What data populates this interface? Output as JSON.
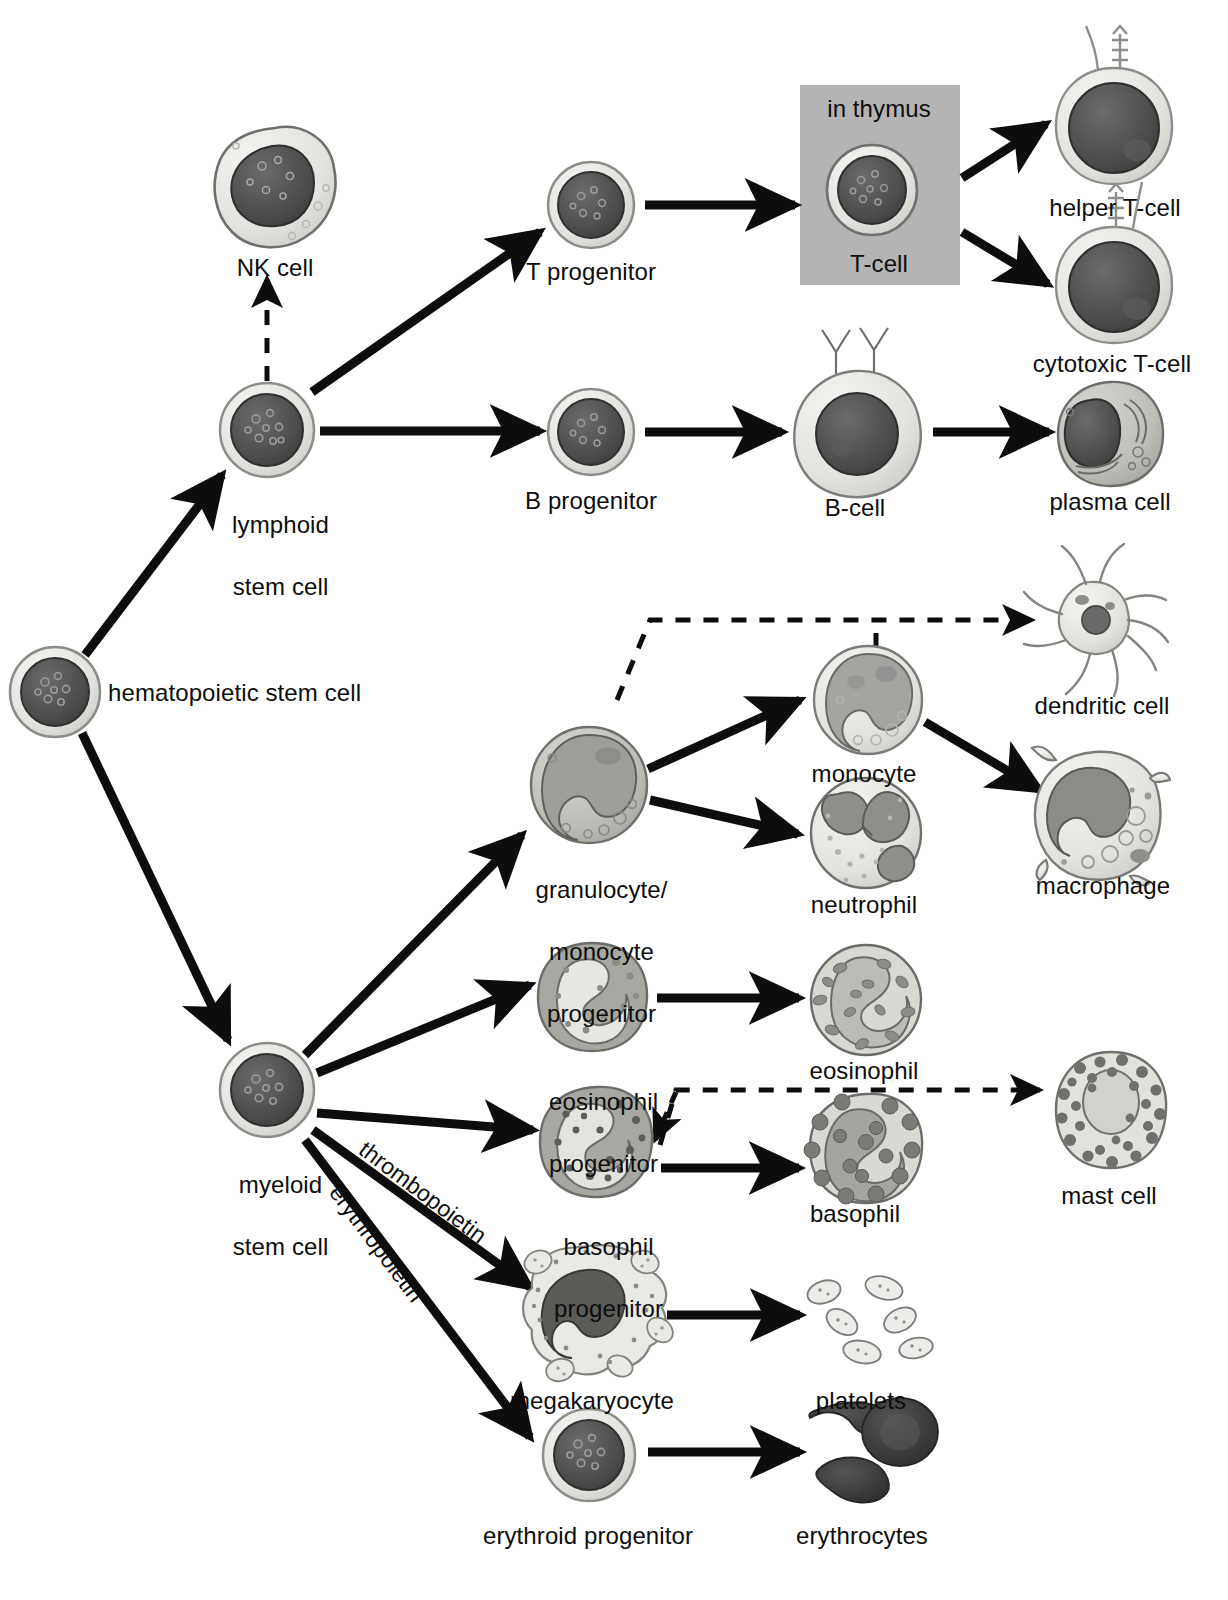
{
  "diagram": {
    "background_color": "#ffffff",
    "ink_color": "#0d0d0d",
    "thymus_box_color": "#b4b4b4"
  },
  "labels": {
    "hematopoietic_stem_cell": "hematopoietic stem cell",
    "lymphoid_stem_cell_line1": "lymphoid",
    "lymphoid_stem_cell_line2": "stem cell",
    "nk_cell": "NK cell",
    "t_progenitor": "T progenitor",
    "b_progenitor": "B progenitor",
    "in_thymus": "in thymus",
    "t_cell": "T-cell",
    "helper_t_cell": "helper T-cell",
    "cytotoxic_t_cell": "cytotoxic T-cell",
    "b_cell": "B-cell",
    "plasma_cell": "plasma cell",
    "myeloid_stem_cell_line1": "myeloid",
    "myeloid_stem_cell_line2": "stem cell",
    "gm_progenitor_line1": "granulocyte/",
    "gm_progenitor_line2": "monocyte",
    "gm_progenitor_line3": "progenitor",
    "monocyte": "monocyte",
    "neutrophil": "neutrophil",
    "dendritic_cell": "dendritic cell",
    "macrophage": "macrophage",
    "eosinophil_progenitor_line1": "eosinophil",
    "eosinophil_progenitor_line2": "progenitor",
    "eosinophil": "eosinophil",
    "basophil_progenitor_line1": "basophil",
    "basophil_progenitor_line2": "progenitor",
    "basophil": "basophil",
    "mast_cell": "mast cell",
    "megakaryocyte": "megakaryocyte",
    "platelets": "platelets",
    "erythroid_progenitor": "erythroid progenitor",
    "erythrocytes": "erythrocytes",
    "thrombopoietin": "thrombopoietin",
    "erythropoietin": "erythropoietin"
  },
  "nodes": [
    {
      "id": "hsc",
      "name": "hematopoietic-stem-cell",
      "cx": 55,
      "cy": 692,
      "r": 45,
      "type": "round-stem"
    },
    {
      "id": "lymphoid",
      "name": "lymphoid-stem-cell",
      "cx": 267,
      "cy": 430,
      "r": 47,
      "type": "round-stem"
    },
    {
      "id": "nk",
      "name": "nk-cell",
      "cx": 275,
      "cy": 186,
      "r": 60,
      "type": "nk"
    },
    {
      "id": "tprog",
      "name": "t-progenitor",
      "cx": 591,
      "cy": 205,
      "r": 43,
      "type": "round-stem"
    },
    {
      "id": "bprog",
      "name": "b-progenitor",
      "cx": 591,
      "cy": 432,
      "r": 43,
      "type": "round-stem"
    },
    {
      "id": "tcell",
      "name": "t-cell",
      "cx": 872,
      "cy": 190,
      "r": 44,
      "type": "round-stem"
    },
    {
      "id": "helperT",
      "name": "helper-t-cell",
      "cx": 1114,
      "cy": 126,
      "r": 58,
      "type": "tlympho"
    },
    {
      "id": "cytoT",
      "name": "cytotoxic-t-cell",
      "cx": 1114,
      "cy": 285,
      "r": 58,
      "type": "tlympho"
    },
    {
      "id": "bcell",
      "name": "b-cell",
      "cx": 855,
      "cy": 433,
      "r": 62,
      "type": "bcell"
    },
    {
      "id": "plasma",
      "name": "plasma-cell",
      "cx": 1110,
      "cy": 432,
      "r": 52,
      "type": "plasma"
    },
    {
      "id": "myeloid",
      "name": "myeloid-stem-cell",
      "cx": 267,
      "cy": 1090,
      "r": 47,
      "type": "round-stem"
    },
    {
      "id": "gmprog",
      "name": "granulocyte-monocyte-progenitor",
      "cx": 589,
      "cy": 785,
      "r": 58,
      "type": "gmprog"
    },
    {
      "id": "monocyte",
      "name": "monocyte",
      "cx": 868,
      "cy": 700,
      "r": 54,
      "type": "monocyte"
    },
    {
      "id": "neutrophil",
      "name": "neutrophil",
      "cx": 866,
      "cy": 833,
      "r": 55,
      "type": "neutrophil"
    },
    {
      "id": "dendritic",
      "name": "dendritic-cell",
      "cx": 1090,
      "cy": 620,
      "r": 62,
      "type": "dendritic"
    },
    {
      "id": "macrophage",
      "name": "macrophage",
      "cx": 1095,
      "cy": 815,
      "r": 62,
      "type": "macrophage"
    },
    {
      "id": "eosprog",
      "name": "eosinophil-progenitor",
      "cx": 592,
      "cy": 997,
      "r": 54,
      "type": "eosprog"
    },
    {
      "id": "eos",
      "name": "eosinophil",
      "cx": 866,
      "cy": 1000,
      "r": 55,
      "type": "eosinophil"
    },
    {
      "id": "basprog",
      "name": "basophil-progenitor",
      "cx": 596,
      "cy": 1142,
      "r": 55,
      "type": "basprog"
    },
    {
      "id": "bas",
      "name": "basophil",
      "cx": 866,
      "cy": 1148,
      "r": 55,
      "type": "basophil"
    },
    {
      "id": "mast",
      "name": "mast-cell",
      "cx": 1111,
      "cy": 1110,
      "r": 57,
      "type": "mast"
    },
    {
      "id": "megakaryocyte",
      "name": "megakaryocyte",
      "cx": 589,
      "cy": 1310,
      "r": 64,
      "type": "megakaryocyte"
    },
    {
      "id": "platelets",
      "name": "platelets",
      "cx": 862,
      "cy": 1318,
      "r": 48,
      "type": "platelets"
    },
    {
      "id": "erythroid",
      "name": "erythroid-progenitor",
      "cx": 589,
      "cy": 1455,
      "r": 46,
      "type": "round-stem"
    },
    {
      "id": "erythrocytes",
      "name": "erythrocytes",
      "cx": 865,
      "cy": 1452,
      "r": 52,
      "type": "erythrocytes"
    }
  ],
  "edges": [
    {
      "from": "hsc",
      "to": "lymphoid",
      "style": "solid"
    },
    {
      "from": "hsc",
      "to": "myeloid",
      "style": "solid"
    },
    {
      "from": "lymphoid",
      "to": "nk",
      "style": "dashed"
    },
    {
      "from": "lymphoid",
      "to": "tprog",
      "style": "solid"
    },
    {
      "from": "lymphoid",
      "to": "bprog",
      "style": "solid"
    },
    {
      "from": "tprog",
      "to": "tcell",
      "style": "solid"
    },
    {
      "from": "tcell",
      "to": "helperT",
      "style": "solid"
    },
    {
      "from": "tcell",
      "to": "cytoT",
      "style": "solid"
    },
    {
      "from": "bprog",
      "to": "bcell",
      "style": "solid"
    },
    {
      "from": "bcell",
      "to": "plasma",
      "style": "solid"
    },
    {
      "from": "myeloid",
      "to": "gmprog",
      "style": "solid"
    },
    {
      "from": "myeloid",
      "to": "eosprog",
      "style": "solid"
    },
    {
      "from": "myeloid",
      "to": "basprog",
      "style": "solid",
      "label": "thrombopoietin"
    },
    {
      "from": "myeloid",
      "to": "megakaryocyte",
      "style": "solid",
      "label": "thrombopoietin"
    },
    {
      "from": "myeloid",
      "to": "erythroid",
      "style": "solid",
      "label": "erythropoietin"
    },
    {
      "from": "gmprog",
      "to": "monocyte",
      "style": "solid"
    },
    {
      "from": "gmprog",
      "to": "neutrophil",
      "style": "solid"
    },
    {
      "from": "gmprog",
      "to": "dendritic",
      "style": "dashed"
    },
    {
      "from": "monocyte",
      "to": "dendritic",
      "style": "dashed"
    },
    {
      "from": "monocyte",
      "to": "macrophage",
      "style": "solid"
    },
    {
      "from": "eosprog",
      "to": "eos",
      "style": "solid"
    },
    {
      "from": "basprog",
      "to": "bas",
      "style": "solid"
    },
    {
      "from": "basprog",
      "to": "mast",
      "style": "dashed"
    },
    {
      "from": "megakaryocyte",
      "to": "platelets",
      "style": "solid"
    },
    {
      "from": "erythroid",
      "to": "erythrocytes",
      "style": "solid"
    }
  ]
}
